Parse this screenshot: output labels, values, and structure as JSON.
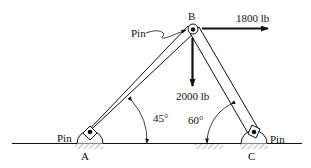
{
  "diagram": {
    "type": "two-member pin-jointed frame",
    "nodes": {
      "A": {
        "label": "A",
        "support": "Pin"
      },
      "B": {
        "label": "B",
        "support": "Pin"
      },
      "C": {
        "label": "C",
        "support": "Pin"
      }
    },
    "members": [
      {
        "from": "A",
        "to": "B",
        "angle_label": "45°"
      },
      {
        "from": "C",
        "to": "B",
        "angle_label": "60°"
      }
    ],
    "loads": [
      {
        "at": "B",
        "direction": "right",
        "label": "1800 lb"
      },
      {
        "at": "B",
        "direction": "down",
        "label": "2000 lb"
      }
    ],
    "labels": {
      "pin_A": "Pin",
      "pin_B": "Pin",
      "pin_C": "Pin",
      "node_A": "A",
      "node_B": "B",
      "node_C": "C",
      "load_horizontal": "1800 lb",
      "load_vertical": "2000 lb",
      "angle_A": "45°",
      "angle_C": "60°"
    },
    "colors": {
      "ink": "#111111",
      "background": "#ffffff"
    }
  }
}
